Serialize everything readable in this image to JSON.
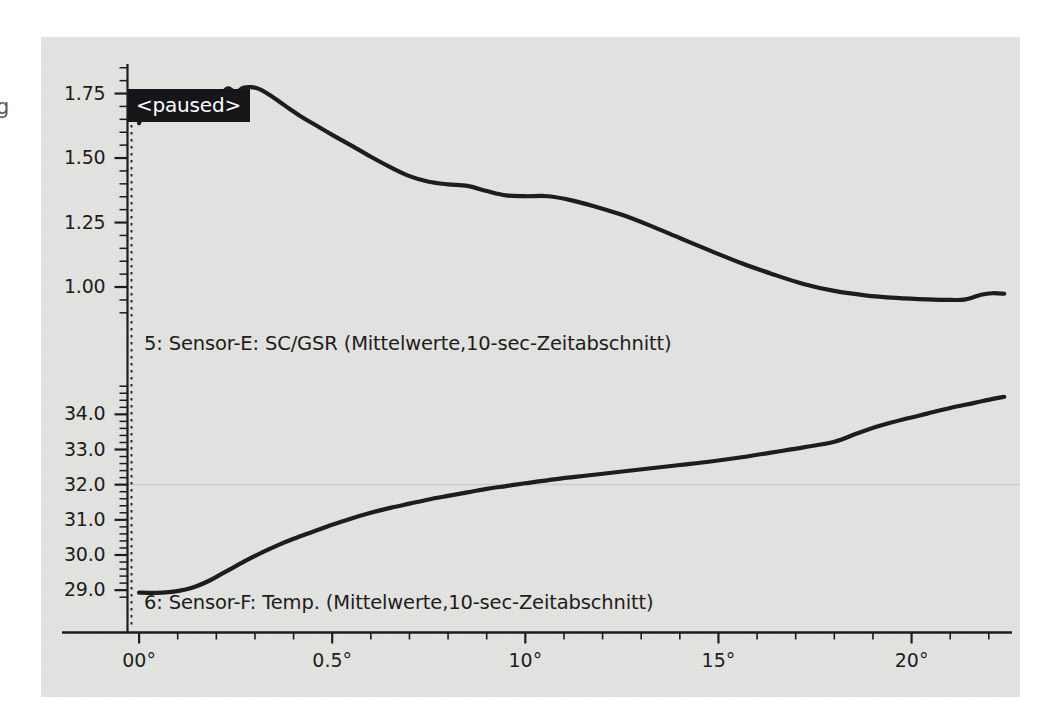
{
  "panel": {
    "background_color": "#e3e3e1",
    "page_background": "#ffffff",
    "line_color": "#1d1d1b"
  },
  "overlay": {
    "paused_label": "<paused>",
    "paused_bg": "#16161a",
    "paused_fg": "#ffffff",
    "edge_fragment": "g"
  },
  "chart_data": {
    "type": "line",
    "title": "",
    "subtitle": "",
    "xlabel": "",
    "ylabel": "",
    "grid": false,
    "legend_position": "inline-below-series",
    "annotations": [
      {
        "text": "<paused>",
        "x_value": 0.0,
        "panel": "upper",
        "style": "white-on-black"
      }
    ],
    "x_axis": {
      "tick_labels": [
        "00°",
        "0.5°",
        "10°",
        "15°",
        "20°"
      ],
      "tick_values": [
        0,
        5,
        10,
        15,
        20
      ],
      "minor_ticks_per_major": 5,
      "xlim": [
        -0.3,
        22.6
      ]
    },
    "panels": [
      {
        "name": "upper",
        "series_label": "5: Sensor-E: SC/GSR (Mittelwerte,10-sec-Zeitabschnitt)",
        "series_index": 5,
        "sensor": "Sensor-E",
        "measure": "SC/GSR",
        "aggregation": "Mittelwerte,10-sec-Zeitabschnitt",
        "y_tick_labels": [
          "1.75",
          "1.50",
          "1.25",
          "1.00"
        ],
        "y_tick_values": [
          1.75,
          1.5,
          1.25,
          1.0
        ],
        "ylim": [
          0.88,
          1.88
        ],
        "x": [
          0.0,
          0.12,
          0.25,
          0.4,
          0.55,
          0.7,
          0.85,
          1.0,
          1.15,
          1.3,
          1.5,
          1.7,
          1.9,
          2.1,
          2.3,
          2.5,
          2.7,
          2.9,
          3.1,
          3.3,
          3.6,
          3.9,
          4.2,
          4.6,
          5.0,
          5.5,
          6.0,
          6.5,
          7.0,
          7.5,
          8.0,
          8.5,
          9.0,
          9.5,
          10.0,
          10.6,
          11.2,
          11.8,
          12.5,
          13.2,
          14.0,
          14.8,
          15.6,
          16.4,
          17.2,
          18.0,
          18.8,
          19.6,
          20.4,
          21.0,
          21.4,
          21.8,
          22.1,
          22.4
        ],
        "y": [
          1.635,
          1.7,
          1.722,
          1.7,
          1.715,
          1.735,
          1.722,
          1.712,
          1.718,
          1.725,
          1.72,
          1.706,
          1.712,
          1.742,
          1.77,
          1.755,
          1.772,
          1.775,
          1.768,
          1.752,
          1.722,
          1.69,
          1.66,
          1.625,
          1.59,
          1.548,
          1.505,
          1.465,
          1.43,
          1.408,
          1.398,
          1.392,
          1.372,
          1.355,
          1.352,
          1.352,
          1.336,
          1.312,
          1.28,
          1.24,
          1.19,
          1.14,
          1.092,
          1.05,
          1.012,
          0.985,
          0.968,
          0.958,
          0.952,
          0.95,
          0.952,
          0.97,
          0.976,
          0.974
        ]
      },
      {
        "name": "lower",
        "series_label": "6: Sensor-F: Temp. (Mittelwerte,10-sec-Zeitabschnitt)",
        "series_index": 6,
        "sensor": "Sensor-F",
        "measure": "Temp.",
        "aggregation": "Mittelwerte,10-sec-Zeitabschnitt",
        "y_tick_labels": [
          "34.0",
          "33.0",
          "32.0",
          "31.0",
          "30.0",
          "29.0"
        ],
        "y_tick_values": [
          34.0,
          33.0,
          32.0,
          31.0,
          30.0,
          29.0
        ],
        "ylim": [
          28.72,
          34.92
        ],
        "gridline_at": 32.0,
        "x": [
          0.0,
          0.3,
          0.6,
          0.9,
          1.2,
          1.5,
          1.8,
          2.1,
          2.4,
          2.8,
          3.2,
          3.6,
          4.0,
          4.5,
          5.0,
          5.5,
          6.0,
          6.5,
          7.0,
          7.5,
          8.0,
          8.5,
          9.0,
          9.5,
          10.0,
          10.8,
          11.6,
          12.4,
          13.2,
          14.0,
          14.8,
          15.6,
          16.4,
          17.2,
          18.0,
          18.6,
          19.2,
          19.8,
          20.4,
          21.0,
          21.6,
          22.1,
          22.4
        ],
        "y": [
          28.93,
          28.92,
          28.93,
          28.96,
          29.02,
          29.12,
          29.26,
          29.44,
          29.62,
          29.86,
          30.08,
          30.28,
          30.46,
          30.66,
          30.86,
          31.04,
          31.2,
          31.34,
          31.46,
          31.58,
          31.68,
          31.78,
          31.88,
          31.96,
          32.04,
          32.16,
          32.26,
          32.36,
          32.46,
          32.56,
          32.66,
          32.78,
          32.92,
          33.06,
          33.22,
          33.46,
          33.68,
          33.86,
          34.02,
          34.18,
          34.32,
          34.44,
          34.5
        ]
      }
    ]
  }
}
